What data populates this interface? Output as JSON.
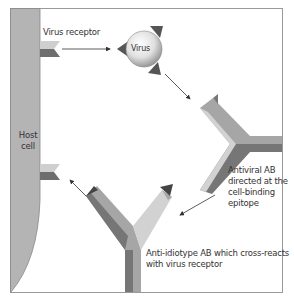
{
  "diagram": {
    "host_cell_label_line1": "Host",
    "host_cell_label_line2": "cell",
    "virus_receptor_label": "Virus receptor",
    "virus_label": "Virus",
    "antiviral_ab_label": [
      "Antiviral AB",
      "directed at the",
      "cell-binding",
      "epitope"
    ],
    "anti_idiotype_label": [
      "Anti-idiotype AB which cross-reacts",
      "with virus receptor"
    ],
    "colors": {
      "host_cell": "#b4b4b4",
      "receptor_light": "#cfcfcf",
      "receptor_dark": "#6e6e6e",
      "ab_light": "#d2d2d2",
      "ab_mid": "#a6a6a6",
      "ab_dark": "#767676",
      "frame": "#999999"
    }
  }
}
